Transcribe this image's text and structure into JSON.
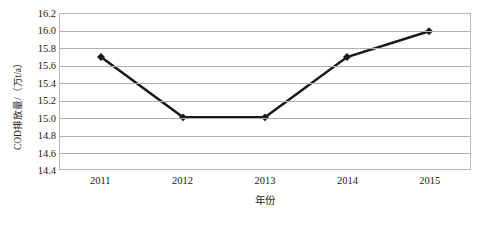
{
  "chart_data": {
    "type": "line",
    "title": "",
    "subtitle": "",
    "xlabel": "年份",
    "ylabel": "COD排放量/（万t/a）",
    "categories": [
      "2011",
      "2012",
      "2013",
      "2014",
      "2015"
    ],
    "values": [
      15.7,
      15.0,
      15.0,
      15.7,
      16.0
    ],
    "series": [
      {
        "name": "COD排放量",
        "values": [
          15.7,
          15.0,
          15.0,
          15.7,
          16.0
        ]
      }
    ],
    "ylim": [
      14.4,
      16.2
    ],
    "ytick_step": 0.2,
    "ytick_labels": [
      "16.2",
      "16.0",
      "15.8",
      "15.6",
      "15.4",
      "15.2",
      "15.0",
      "14.8",
      "14.6",
      "14.4"
    ],
    "ytick_values": [
      16.2,
      16.0,
      15.8,
      15.6,
      15.4,
      15.2,
      15.0,
      14.8,
      14.6,
      14.4
    ],
    "xtick_labels": [
      "2011",
      "2012",
      "2013",
      "2014",
      "2015"
    ],
    "grid": "horizontal",
    "legend": "none",
    "marker": "diamond",
    "line_color": "#1a1a1a",
    "marker_color": "#1a1a1a",
    "grid_color": "#b0b0b0",
    "border_color": "#b9b9b9",
    "background_color": "#ffffff",
    "annotations": []
  }
}
